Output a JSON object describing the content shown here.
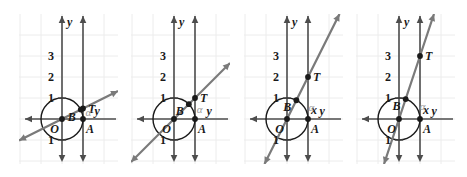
{
  "figure": {
    "panel_count": 4,
    "background_color": "#ffffff",
    "grid_color": "#ececec",
    "axis_color": "#4d4d4d",
    "circle_color": "#1a1a1a",
    "line_color": "#7a7a7a",
    "point_color": "#1a1a1a",
    "label_color": "#1a1a1a",
    "alpha_color": "#9a9a9a"
  },
  "chart_data": {
    "type": "scatter",
    "xlabel": "x",
    "ylabel": "y",
    "xlim": [
      -2,
      2
    ],
    "ylim": [
      -1.5,
      3.5
    ],
    "grid": true,
    "legend": "none",
    "shared": {
      "circle": {
        "center": [
          0,
          0
        ],
        "radius": 1
      },
      "vertical_line_x": 1,
      "y_tick_labels": [
        "3",
        "2",
        "1",
        "1"
      ],
      "y_tick_values": [
        3,
        2,
        1,
        -1
      ],
      "origin_label": "O",
      "point_a": {
        "label": "A",
        "x": 1,
        "y": 0
      },
      "angle_label": "α"
    },
    "panels": [
      {
        "index": 1,
        "slope": 0.5,
        "point_t": {
          "label": "T",
          "x": 1,
          "y": 0.5
        },
        "point_b": {
          "label": "B",
          "x": 0.894,
          "y": 0.447
        },
        "x_axis_label": "",
        "y_axis_label": "y",
        "tangent_value": "0.5"
      },
      {
        "index": 2,
        "slope": 1,
        "point_t": {
          "label": "T",
          "x": 1,
          "y": 1
        },
        "point_b": {
          "label": "B",
          "x": 0.707,
          "y": 0.707
        },
        "x_axis_label": "",
        "y_axis_label": "y",
        "tangent_value": "1"
      },
      {
        "index": 3,
        "slope": 2,
        "point_t": {
          "label": "T",
          "x": 1,
          "y": 2
        },
        "point_b": {
          "label": "B",
          "x": 0.447,
          "y": 0.894
        },
        "x_axis_label": "x",
        "y_axis_label": "y",
        "tangent_value": "2"
      },
      {
        "index": 4,
        "slope": 3,
        "point_t": {
          "label": "T",
          "x": 1,
          "y": 3
        },
        "point_b": {
          "label": "B",
          "x": 0.316,
          "y": 0.949
        },
        "x_axis_label": "x",
        "y_axis_label": "y",
        "tangent_value": "3"
      }
    ]
  }
}
